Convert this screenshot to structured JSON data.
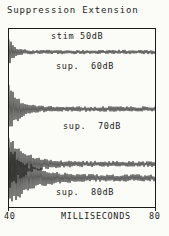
{
  "page": {
    "title": "Suppression Extension"
  },
  "axis": {
    "min_label": "40",
    "max_label": "80",
    "title": "MILLISECONDS"
  },
  "colors": {
    "ink": "#1b1b1b",
    "paper": "#fbfbf8"
  },
  "chart_data": {
    "type": "line",
    "title": "Suppression Extension",
    "xlabel": "MILLISECONDS",
    "xlim": [
      40,
      80
    ],
    "x_tick_labels": [
      "40",
      "80"
    ],
    "grid": false,
    "legend_position": "inline labels beside each trace",
    "series": [
      {
        "label": "stim 50dB",
        "row": 1,
        "peak_amplitude_rel": 1.0,
        "approx_burst_end_ms": 46
      },
      {
        "label": "sup.  60dB",
        "row": 2,
        "peak_amplitude_rel": 1.9,
        "approx_burst_end_ms": 51
      },
      {
        "label": "sup.  70dB",
        "row": 3,
        "peak_amplitude_rel": 2.1,
        "approx_burst_end_ms": 56
      },
      {
        "label": "sup.  80dB",
        "row": 4,
        "peak_amplitude_rel": 2.2,
        "approx_burst_end_ms": 61
      }
    ]
  },
  "render": {
    "plot_w": 146,
    "plot_h": 178,
    "traces": [
      {
        "base": 23,
        "amp": 14,
        "tau": 5,
        "ring": 2.2,
        "seed": 11
      },
      {
        "base": 80,
        "amp": 27,
        "tau": 10,
        "ring": 2.8,
        "seed": 22
      },
      {
        "base": 135,
        "amp": 29,
        "tau": 15,
        "ring": 3.0,
        "seed": 33
      },
      {
        "base": 149,
        "amp": 31,
        "tau": 21,
        "ring": 3.6,
        "seed": 44
      }
    ]
  }
}
